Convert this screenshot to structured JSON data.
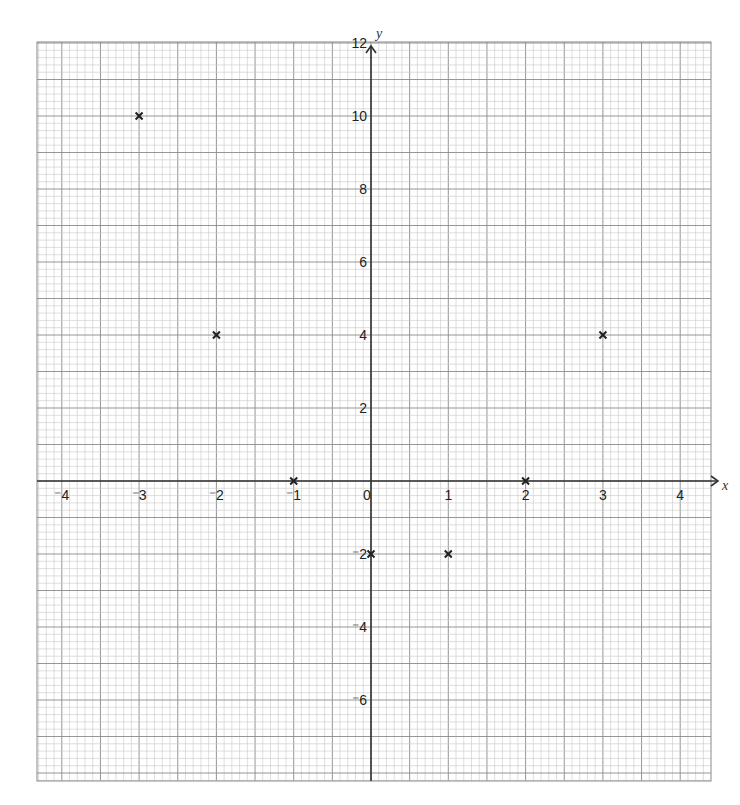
{
  "chart_data": {
    "type": "scatter",
    "title": "",
    "xlabel": "x",
    "ylabel": "y",
    "xlim": [
      -4.3,
      4.4
    ],
    "ylim": [
      -7.9,
      12.3
    ],
    "grid": true,
    "grid_minor_x": 0.1,
    "grid_minor_y": 0.2,
    "x_ticks": [
      -4,
      -3,
      -2,
      -1,
      0,
      1,
      2,
      3,
      4
    ],
    "x_tick_labels": [
      "⁻4",
      "⁻3",
      "⁻2",
      "⁻1",
      "0",
      "1",
      "2",
      "3",
      "4"
    ],
    "y_ticks": [
      -6,
      -4,
      -2,
      2,
      4,
      6,
      8,
      10,
      12
    ],
    "y_tick_labels": [
      "⁻6",
      "⁻4",
      "⁻2",
      "2",
      "4",
      "6",
      "8",
      "10",
      "12"
    ],
    "marker": "x",
    "series": [
      {
        "name": "plotted points",
        "x": [
          -3,
          -2,
          -1,
          0,
          1,
          2,
          3
        ],
        "y": [
          10,
          4,
          0,
          -2,
          -2,
          0,
          4
        ]
      }
    ],
    "colors": {
      "grid_minor": "#c8c8c8",
      "grid_major": "#8a8a8a",
      "axis": "#333333",
      "marker": "#222222"
    }
  }
}
